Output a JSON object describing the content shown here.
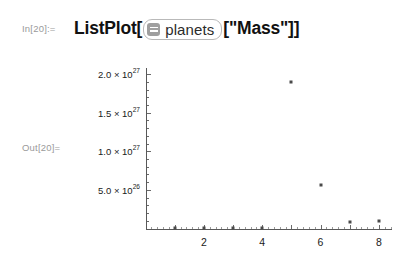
{
  "cell": {
    "in_label": "In[20]:=",
    "out_label": "Out[20]=",
    "code_prefix": "ListPlot[",
    "code_suffix": "[\"Mass\"]]",
    "entity_token": {
      "label": "planets",
      "icon": "list-entity-icon"
    }
  },
  "chart_data": {
    "type": "scatter",
    "title": "",
    "xlabel": "",
    "ylabel": "",
    "x": [
      1,
      2,
      3,
      4,
      5,
      6,
      7,
      8
    ],
    "values": [
      3.3e+23,
      4.87e+24,
      5.97e+24,
      6.42e+23,
      1.9e+27,
      5.68e+26,
      8.68e+25,
      1.02e+26
    ],
    "series": [
      {
        "name": "Mass",
        "values": [
          3.3e+23,
          4.87e+24,
          5.97e+24,
          6.42e+23,
          1.9e+27,
          5.68e+26,
          8.68e+25,
          1.02e+26
        ]
      }
    ],
    "xlim": [
      0,
      8.45
    ],
    "ylim": [
      0,
      2.08e+27
    ],
    "grid": false,
    "legend": "none",
    "x_ticks": [
      2,
      4,
      6,
      8
    ],
    "x_tick_labels": [
      "2",
      "4",
      "6",
      "8"
    ],
    "x_minor_ticks": [
      1,
      3,
      5,
      7
    ],
    "y_ticks": [
      5e+26,
      1e+27,
      1.5e+27,
      2e+27
    ],
    "y_tick_labels": [
      {
        "mantissa": "5.0 × 10",
        "exponent": "26",
        "value": 5e+26
      },
      {
        "mantissa": "1.0 × 10",
        "exponent": "27",
        "value": 1e+27
      },
      {
        "mantissa": "1.5 × 10",
        "exponent": "27",
        "value": 1.5e+27
      },
      {
        "mantissa": "2.0 × 10",
        "exponent": "27",
        "value": 2e+27
      }
    ]
  },
  "colors": {
    "point": "#4a4a4a",
    "axis": "#585858",
    "label_gray": "#9a9a9a",
    "token_border": "#b9b9b9",
    "token_icon": "#9f9f9f",
    "background": "#ffffff"
  }
}
